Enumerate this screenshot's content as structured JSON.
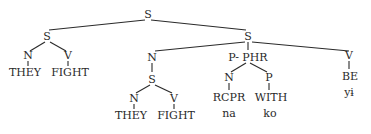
{
  "diagram": {
    "type": "syntax-tree",
    "nodes": {
      "root": {
        "label": "S"
      },
      "s_left": {
        "label": "S"
      },
      "s_left_n": {
        "label": "N"
      },
      "s_left_v": {
        "label": "V"
      },
      "s_left_n_word": {
        "label": "THEY"
      },
      "s_left_v_word": {
        "label": "FIGHT"
      },
      "s_right": {
        "label": "S"
      },
      "np": {
        "label": "N"
      },
      "np_s": {
        "label": "S"
      },
      "np_s_n": {
        "label": "N"
      },
      "np_s_v": {
        "label": "V"
      },
      "np_s_n_word": {
        "label": "THEY"
      },
      "np_s_v_word": {
        "label": "FIGHT"
      },
      "pphr": {
        "label": "P- PHR"
      },
      "pphr_n": {
        "label": "N"
      },
      "pphr_p": {
        "label": "P"
      },
      "pphr_n_word": {
        "label": "RCPR"
      },
      "pphr_p_word": {
        "label": "WITH"
      },
      "pphr_n_gloss": {
        "label": "na"
      },
      "pphr_p_gloss": {
        "label": "ko"
      },
      "v": {
        "label": "V"
      },
      "v_word": {
        "label": "BE"
      },
      "v_gloss": {
        "label": "yɨ"
      }
    }
  }
}
